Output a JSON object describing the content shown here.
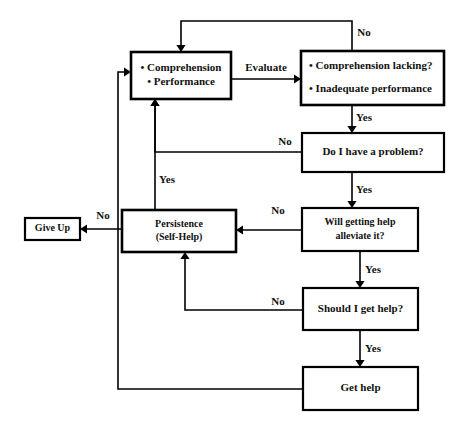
{
  "diagram": {
    "background_color": "#ffffff",
    "line_color": "#000000",
    "text_color": "#111111",
    "width": 460,
    "height": 442
  },
  "nodes": [
    {
      "id": "state",
      "name": "comprehension-performance",
      "x": 131,
      "y": 52,
      "w": 100,
      "h": 47,
      "stroke_width": 2.6,
      "font_size": 11,
      "align": "bullets",
      "lines": [
        "Comprehension",
        "Performance"
      ],
      "text": "• Comprehension  • Performance"
    },
    {
      "id": "evaluate-outcome",
      "name": "comprehension-lacking-inadequate-performance",
      "x": 301,
      "y": 51,
      "w": 143,
      "h": 54,
      "stroke_width": 2.6,
      "font_size": 11,
      "align": "bullets-left",
      "lines": [
        "Comprehension lacking?",
        "Inadequate performance"
      ],
      "text": "• Comprehension lacking?  • Inadequate performance"
    },
    {
      "id": "have-problem",
      "name": "do-i-have-a-problem",
      "x": 302,
      "y": 133,
      "w": 142,
      "h": 39,
      "stroke_width": 2.2,
      "font_size": 11,
      "align": "center",
      "lines": [
        "Do I have a problem?"
      ],
      "text": "Do I have a problem?"
    },
    {
      "id": "persistence",
      "name": "persistence-self-help",
      "x": 122,
      "y": 210,
      "w": 114,
      "h": 42,
      "stroke_width": 2.6,
      "font_size": 10,
      "align": "center",
      "lines": [
        "Persistence",
        "(Self-Help)"
      ],
      "text": "Persistence (Self-Help)"
    },
    {
      "id": "give-up",
      "name": "give-up",
      "x": 25,
      "y": 218,
      "w": 55,
      "h": 22,
      "stroke_width": 2.2,
      "font_size": 10,
      "align": "center",
      "lines": [
        "Give Up"
      ],
      "text": "Give Up"
    },
    {
      "id": "help-alleviate",
      "name": "will-getting-help-alleviate-it",
      "x": 302,
      "y": 208,
      "w": 116,
      "h": 43,
      "stroke_width": 2.2,
      "font_size": 10,
      "align": "center",
      "lines": [
        "Will getting help",
        "alleviate it?"
      ],
      "text": "Will getting help alleviate it?"
    },
    {
      "id": "should-get-help",
      "name": "should-i-get-help",
      "x": 303,
      "y": 288,
      "w": 115,
      "h": 42,
      "stroke_width": 2.2,
      "font_size": 11,
      "align": "center",
      "lines": [
        "Should I get help?"
      ],
      "text": "Should I get help?"
    },
    {
      "id": "get-help",
      "name": "get-help",
      "x": 303,
      "y": 367,
      "w": 115,
      "h": 43,
      "stroke_width": 2.2,
      "font_size": 11,
      "align": "center",
      "lines": [
        "Get help"
      ],
      "text": "Get help"
    }
  ],
  "edges": [
    {
      "id": "evaluate",
      "name": "edge-evaluate",
      "from": "state",
      "to": "evaluate-outcome",
      "label": "Evaluate",
      "label_x": 266,
      "label_y": 68,
      "path": "M 231 79 L 294 79",
      "arrow": {
        "x": 301,
        "y": 79,
        "dir": "right"
      }
    },
    {
      "id": "outcome-no",
      "name": "edge-outcome-no",
      "from": "evaluate-outcome",
      "to": "state",
      "label": "No",
      "label_x": 364,
      "label_y": 33,
      "path": "M 352 51 L 352 21 L 181 21 L 181 45",
      "arrow": {
        "x": 181,
        "y": 52,
        "dir": "down"
      }
    },
    {
      "id": "outcome-yes",
      "name": "edge-outcome-yes",
      "from": "evaluate-outcome",
      "to": "have-problem",
      "label": "Yes",
      "label_x": 364,
      "label_y": 118,
      "path": "M 352 105 L 352 126",
      "arrow": {
        "x": 352,
        "y": 133,
        "dir": "down"
      }
    },
    {
      "id": "problem-no",
      "name": "edge-problem-no",
      "from": "have-problem",
      "to": "state",
      "label": "No",
      "label_x": 285,
      "label_y": 142,
      "path": "M 302 152 L 155 152 L 155 106",
      "arrow": {
        "x": 155,
        "y": 99,
        "dir": "up"
      }
    },
    {
      "id": "problem-yes",
      "name": "edge-problem-yes",
      "from": "have-problem",
      "to": "help-alleviate",
      "label": "Yes",
      "label_x": 364,
      "label_y": 190,
      "path": "M 352 172 L 352 201",
      "arrow": {
        "x": 352,
        "y": 208,
        "dir": "down"
      }
    },
    {
      "id": "alleviate-no",
      "name": "edge-alleviate-no",
      "from": "help-alleviate",
      "to": "persistence",
      "label": "No",
      "label_x": 278,
      "label_y": 211,
      "path": "M 302 230 L 243 230",
      "arrow": {
        "x": 236,
        "y": 230,
        "dir": "left"
      }
    },
    {
      "id": "alleviate-yes",
      "name": "edge-alleviate-yes",
      "from": "help-alleviate",
      "to": "should-get-help",
      "label": "Yes",
      "label_x": 373,
      "label_y": 270,
      "path": "M 360 251 L 360 281",
      "arrow": {
        "x": 360,
        "y": 288,
        "dir": "down"
      }
    },
    {
      "id": "should-no",
      "name": "edge-should-no",
      "from": "should-get-help",
      "to": "persistence",
      "label": "No",
      "label_x": 278,
      "label_y": 302,
      "path": "M 303 310 L 185 310 L 185 259",
      "arrow": {
        "x": 185,
        "y": 252,
        "dir": "up"
      }
    },
    {
      "id": "should-yes",
      "name": "edge-should-yes",
      "from": "should-get-help",
      "to": "get-help",
      "label": "Yes",
      "label_x": 373,
      "label_y": 349,
      "path": "M 360 330 L 360 360",
      "arrow": {
        "x": 360,
        "y": 367,
        "dir": "down"
      }
    },
    {
      "id": "persistence-yes",
      "name": "edge-persistence-yes",
      "from": "persistence",
      "to": "state",
      "label": "Yes",
      "label_x": 167,
      "label_y": 180,
      "path": "M 155 210 L 155 106",
      "arrow": {
        "x": 155,
        "y": 99,
        "dir": "up"
      }
    },
    {
      "id": "persistence-no",
      "name": "edge-persistence-no",
      "from": "persistence",
      "to": "give-up",
      "label": "No",
      "label_x": 103,
      "label_y": 216,
      "path": "M 122 229 L 87 229",
      "arrow": {
        "x": 80,
        "y": 229,
        "dir": "left"
      }
    },
    {
      "id": "gethelp-return",
      "name": "edge-get-help-return",
      "from": "get-help",
      "to": "state",
      "label": "",
      "label_x": 0,
      "label_y": 0,
      "path": "M 303 389 L 118 389 L 118 72 L 124 72",
      "arrow": {
        "x": 131,
        "y": 72,
        "dir": "right"
      }
    }
  ]
}
